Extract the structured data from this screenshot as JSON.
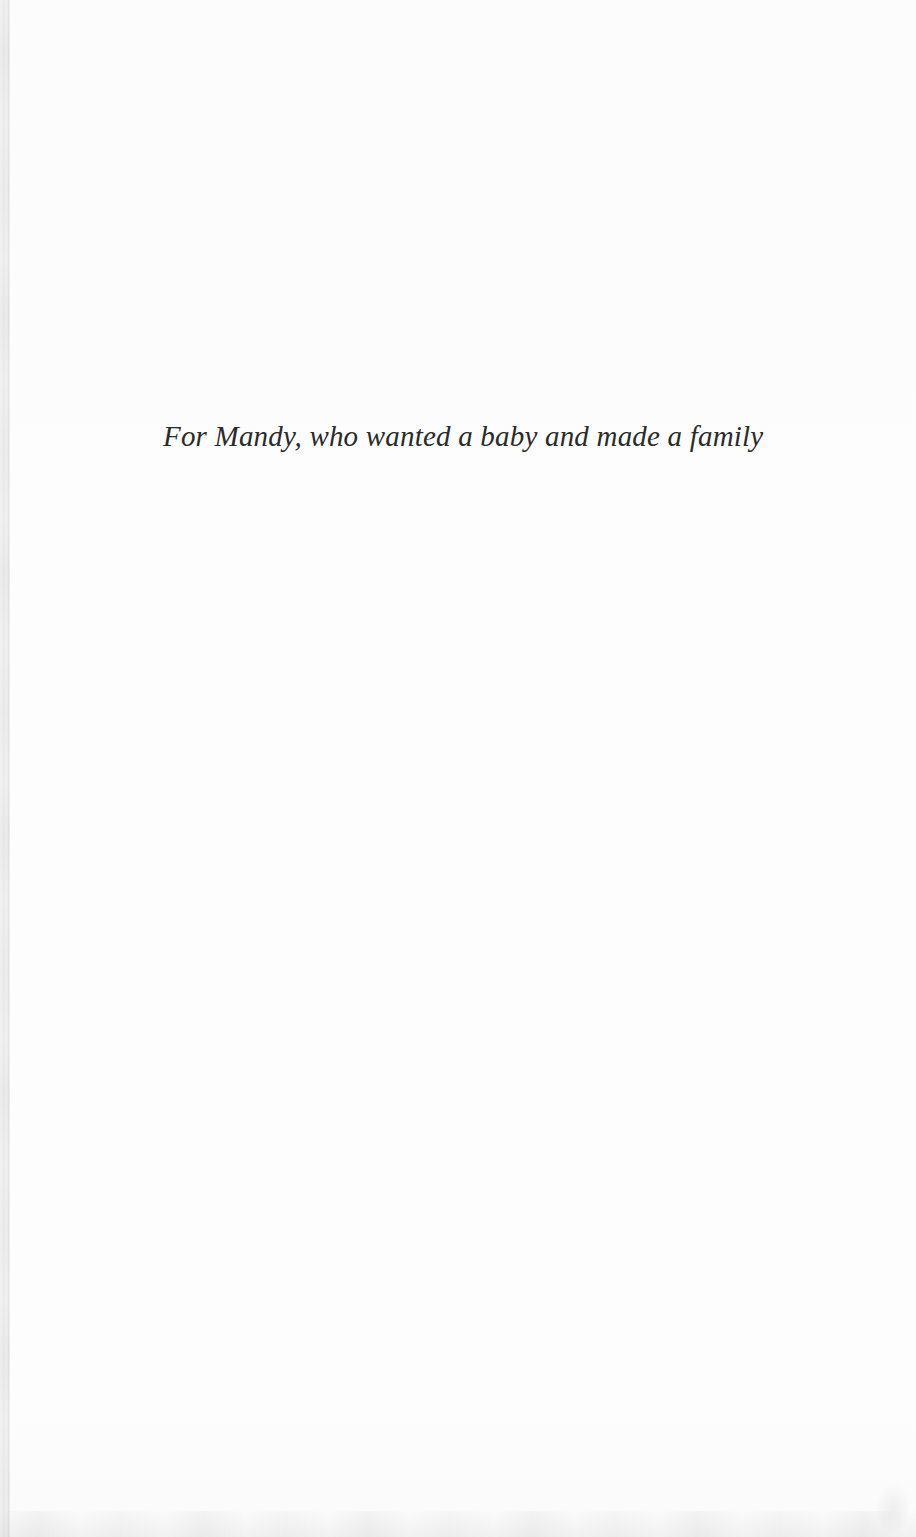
{
  "page": {
    "dedication_text": "For Mandy, who wanted a baby and made a family"
  },
  "colors": {
    "page-bg": "#fdfdfd",
    "edge-strip": "#ebebeb",
    "edge-line": "#e2e2e2",
    "text-ink": "#2b2b2b",
    "bottom-shade": "#efefef"
  }
}
